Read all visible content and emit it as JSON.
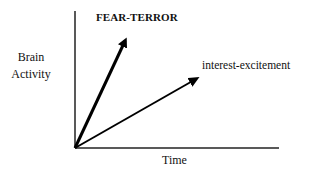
{
  "diagram": {
    "y_axis": {
      "label_line1": "Brain",
      "label_line2": "Activity"
    },
    "x_axis": {
      "label": "Time"
    },
    "arrows": [
      {
        "label": "FEAR-TERROR",
        "style": "bold",
        "from": [
          75,
          148
        ],
        "to": [
          127,
          37
        ],
        "stroke_width": 3,
        "color": "#000000"
      },
      {
        "label": "interest-excitement",
        "style": "normal",
        "from": [
          75,
          148
        ],
        "to": [
          200,
          77
        ],
        "stroke_width": 2,
        "color": "#000000"
      }
    ],
    "axis_color": "#222222",
    "origin": [
      75,
      148
    ]
  }
}
